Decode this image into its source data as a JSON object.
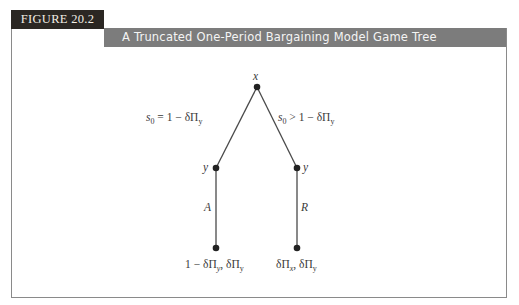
{
  "figure": {
    "label": "FIGURE 20.2",
    "title": "A Truncated One-Period Bargaining Model Game Tree"
  },
  "tree": {
    "root": {
      "label": "x"
    },
    "nodes": [
      {
        "id": "left_y",
        "label": "y"
      },
      {
        "id": "right_y",
        "label": "y"
      }
    ],
    "branches": {
      "left_offer": {
        "lhs": "s",
        "lhs_sub": "0",
        "rest": " = 1 − δΠ",
        "rest_sub": "y"
      },
      "right_offer": {
        "lhs": "s",
        "lhs_sub": "0",
        "rest": " > 1 − δΠ",
        "rest_sub": "y"
      },
      "accept": "A",
      "reject": "R"
    },
    "payoffs": {
      "left": {
        "p1": "1 − δΠ",
        "p1_sub": "y",
        "sep": ", δΠ",
        "p2_sub": "y"
      },
      "right": {
        "p1": "δΠ",
        "p1_sub": "x",
        "sep": ", δΠ",
        "p2_sub": "y"
      }
    }
  },
  "colors": {
    "label_bg": "#2b2723",
    "title_bg": "#7c7c7c",
    "line": "#4a4a4a",
    "node": "#222222"
  }
}
